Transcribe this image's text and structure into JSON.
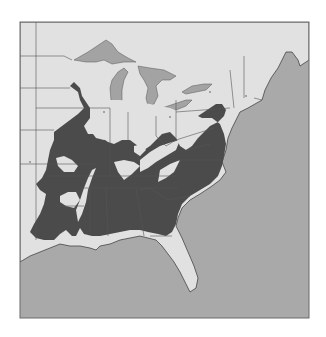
{
  "map": {
    "region": "Eastern United States",
    "type": "species range map",
    "colors": {
      "background": "#ffffff",
      "ocean": "#a9a9a9",
      "land": "#e1e1e1",
      "lakes": "#a3a3a3",
      "range": "#4b4b4b",
      "borders": "#555555",
      "frame": "#6a6a6a"
    },
    "frame": {
      "x": 20,
      "y": 22,
      "width": 289,
      "height": 296
    },
    "legend": null,
    "labels": []
  }
}
